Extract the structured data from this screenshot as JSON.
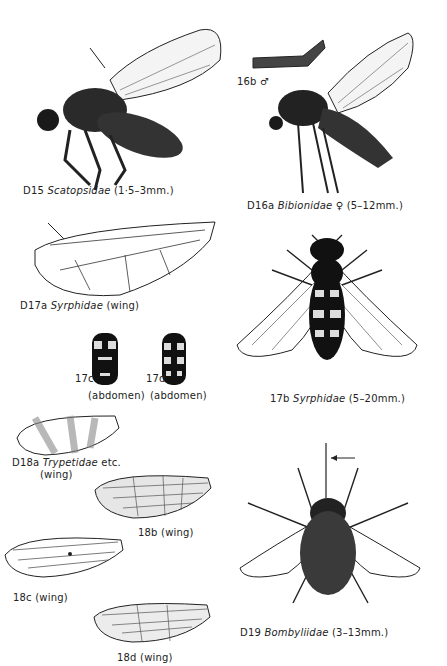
{
  "figures": [
    {
      "id": "D15",
      "code": "D15",
      "family": "Scatopsidae",
      "note": "(1·5–3mm.)"
    },
    {
      "id": "D16a",
      "code": "D16a",
      "family": "Bibionidae",
      "note": "♀ (5–12mm.)"
    },
    {
      "id": "16b",
      "code": "16b",
      "note": "♂"
    },
    {
      "id": "D17a",
      "code": "D17a",
      "family": "Syrphidae",
      "note": "(wing)"
    },
    {
      "id": "17b",
      "code": "17b",
      "family": "Syrphidae",
      "note": "(5–20mm.)"
    },
    {
      "id": "17c",
      "code": "17c",
      "note": "(abdomen)"
    },
    {
      "id": "17d",
      "code": "17d",
      "note": "(abdomen)"
    },
    {
      "id": "D18a",
      "code": "D18a",
      "family": "Trypetidae",
      "note": "etc.",
      "note2": "(wing)"
    },
    {
      "id": "18b",
      "code": "18b",
      "note": "(wing)"
    },
    {
      "id": "18c",
      "code": "18c",
      "note": "(wing)"
    },
    {
      "id": "18d",
      "code": "18d",
      "note": "(wing)"
    },
    {
      "id": "D19",
      "code": "D19",
      "family": "Bombyliidae",
      "note": "(3–13mm.)"
    }
  ],
  "colors": {
    "ink": "#1a1a1a",
    "paper": "#ffffff"
  }
}
